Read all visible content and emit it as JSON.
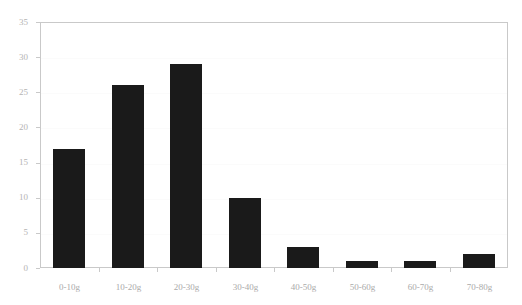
{
  "chart_data": {
    "type": "bar",
    "title": "",
    "subtitle": "",
    "xlabel": "",
    "ylabel": "",
    "categories": [
      "0-10g",
      "10-20g",
      "20-30g",
      "30-40g",
      "40-50g",
      "50-60g",
      "60-70g",
      "70-80g"
    ],
    "values": [
      17,
      26,
      29,
      10,
      3,
      1,
      1,
      2
    ],
    "ylim": [
      0,
      35
    ],
    "ytick_labels": [
      "0",
      "5",
      "10",
      "15",
      "20",
      "25",
      "30",
      "35"
    ],
    "ytick_values": [
      0,
      5,
      10,
      15,
      20,
      25,
      30,
      35
    ],
    "grid": true,
    "legend": false,
    "legend_position": "none",
    "bar_color": "#1a1a1a",
    "axis_color": "#c9c9c9",
    "tick_label_color": "#b4b4b4",
    "grid_color": "#fbfbfb",
    "background_color": "#ffffff"
  }
}
